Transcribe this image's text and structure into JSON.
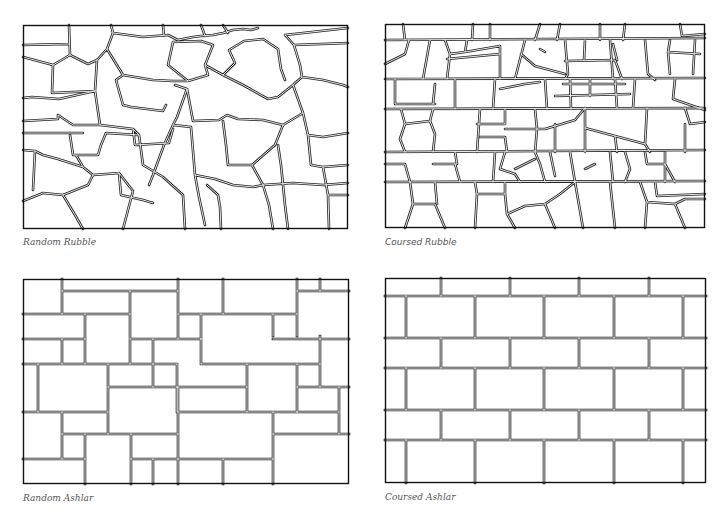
{
  "colors": {
    "background": "#ffffff",
    "line": "#222222",
    "caption": "#555555"
  },
  "panels": [
    {
      "id": "random-rubble",
      "caption": "Random Rubble",
      "type": "rubble-random"
    },
    {
      "id": "coursed-rubble",
      "caption": "Coursed Rubble",
      "type": "rubble-coursed"
    },
    {
      "id": "random-ashlar",
      "caption": "Random Ashlar",
      "type": "ashlar-random"
    },
    {
      "id": "coursed-ashlar",
      "caption": "Coursed Ashlar",
      "type": "ashlar-coursed"
    }
  ]
}
